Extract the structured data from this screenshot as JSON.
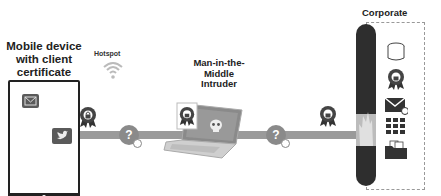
{
  "labels": {
    "mobile_device": "Mobile device with client certificate",
    "hotspot": "Hotspot",
    "mitm": "Man-in-the-Middle Intruder",
    "corporate": "Corporate"
  },
  "icons": {
    "tablet_apps": [
      "mail-icon",
      "twitter-bird-icon"
    ],
    "hotspot": "wifi-icon",
    "connection_markers": [
      "question-bubble-icon",
      "question-bubble-icon"
    ],
    "certificates": [
      "certificate-ribbon-icon",
      "certificate-ribbon-icon",
      "certificate-ribbon-icon"
    ],
    "intruder": "laptop-with-skull-icon",
    "firewall": "firewall-pillar-icon",
    "corporate_resources": [
      "database-icon",
      "certificate-ribbon-icon",
      "mail-icon",
      "app-grid-icon",
      "folder-icon"
    ]
  },
  "colors": {
    "line": "#9a9a9a",
    "dark": "#2e2e2e",
    "icon": "#4a4a4a"
  },
  "question_mark": "?"
}
